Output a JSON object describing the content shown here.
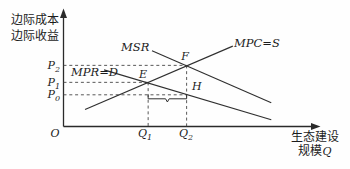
{
  "figure": {
    "y_axis_title_line1": "边际成本",
    "y_axis_title_line2": "边际收益",
    "x_axis_title_line1": "生态建设",
    "x_axis_title_line2_cn": "规模",
    "x_axis_title_line2_var": "Q",
    "origin_label": "O",
    "curve_labels": {
      "msr": "MSR",
      "mpc": "MPC=S",
      "mpr": "MPR=D"
    },
    "point_labels": {
      "e": "E",
      "f": "F",
      "h": "H"
    },
    "y_ticks": [
      {
        "base": "P",
        "sub": "2"
      },
      {
        "base": "P",
        "sub": "1"
      },
      {
        "base": "P",
        "sub": "0"
      }
    ],
    "x_ticks": [
      {
        "base": "Q",
        "sub": "1"
      },
      {
        "base": "Q",
        "sub": "2"
      }
    ]
  },
  "chart_data": {
    "type": "line",
    "title": "",
    "xlabel": "生态建设规模Q",
    "ylabel": "边际成本 边际收益",
    "axes_qualitative": true,
    "x_unit_range": [
      0,
      10
    ],
    "y_unit_range": [
      0,
      10
    ],
    "grid": false,
    "series": [
      {
        "name": "MSR",
        "points": [
          [
            3.45,
            6.7
          ],
          [
            8.1,
            2.1
          ]
        ]
      },
      {
        "name": "MPC=S",
        "points": [
          [
            0.84,
            1.5
          ],
          [
            6.6,
            7.1
          ]
        ]
      },
      {
        "name": "MPR=D",
        "points": [
          [
            1.58,
            5.0
          ],
          [
            8.1,
            0.6
          ]
        ]
      }
    ],
    "key_points": [
      {
        "label": "E",
        "x": 3.3,
        "y": 3.9
      },
      {
        "label": "F",
        "x": 4.8,
        "y": 5.4
      },
      {
        "label": "H",
        "x": 4.8,
        "y": 2.8
      }
    ],
    "y_ticks": [
      {
        "label": "P2",
        "y": 5.4,
        "dash_to_x": 4.8
      },
      {
        "label": "P1",
        "y": 3.9,
        "dash_to_x": 3.3
      },
      {
        "label": "P0",
        "y": 2.8,
        "dash_to_x": 4.8
      }
    ],
    "x_ticks": [
      {
        "label": "Q1",
        "x": 3.3,
        "dash_from_y": 3.9
      },
      {
        "label": "Q2",
        "x": 4.8,
        "dash_from_y": 5.4
      }
    ],
    "brace": {
      "from_x": 3.3,
      "to_x": 4.8
    }
  }
}
